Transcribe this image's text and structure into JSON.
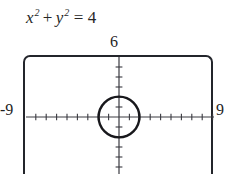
{
  "equation": {
    "lhs_x": "x",
    "lhs_x_exp": "2",
    "plus": "+",
    "lhs_y": "y",
    "lhs_y_exp": "2",
    "equals": "=",
    "rhs": "4",
    "full_text": "x2 + y2 = 4"
  },
  "window_labels": {
    "top": "6",
    "left": "-9",
    "right": "9"
  },
  "colors": {
    "frame": "#23252b",
    "axis": "#3a3a40",
    "curve": "#18181c",
    "text": "#1f1f1f",
    "background": "#ffffff"
  },
  "chart_data": {
    "type": "line",
    "xlabel": "",
    "ylabel": "",
    "xlim": [
      -9,
      9
    ],
    "ylim": [
      -6,
      6
    ],
    "grid": false,
    "legend": null,
    "x_tick_step": 1,
    "y_tick_step": 1,
    "annotations": [
      "6",
      "-9",
      "9"
    ],
    "series": [
      {
        "name": "circle x^2 + y^2 = 4",
        "shape": "circle",
        "center": [
          0,
          0
        ],
        "radius": 2
      }
    ]
  },
  "geometry": {
    "viewport_px": {
      "left": 23,
      "top": 55,
      "width": 190,
      "height": 125
    },
    "origin_px": {
      "x": 117,
      "y": 115
    },
    "x_unit_px": 10.4,
    "y_unit_px": 10.0,
    "circle_radius_px": 20.8
  }
}
